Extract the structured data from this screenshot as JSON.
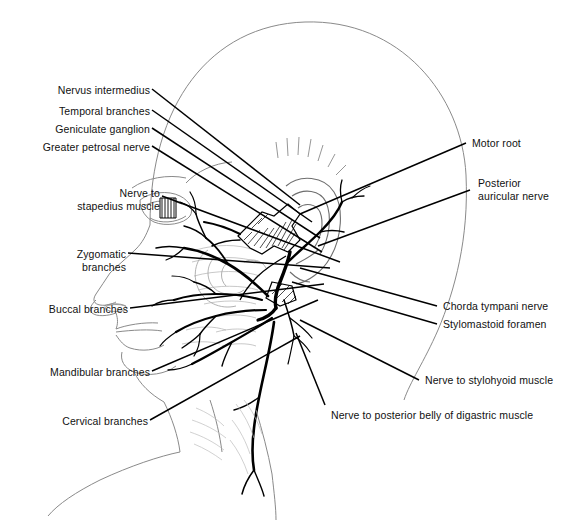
{
  "figure": {
    "orientation": "left lateral view, facing left",
    "line_color": "#000000",
    "outline_color": "#808080",
    "background": "#ffffff"
  },
  "labels": {
    "left": [
      {
        "id": "nervus-intermedius",
        "text": "Nervus intermedius",
        "x": 50,
        "y": 84,
        "anchor_x": 152,
        "anchor_y": 89,
        "target_x": 300,
        "target_y": 205
      },
      {
        "id": "temporal-branches",
        "text": "Temporal branches",
        "x": 38,
        "y": 105,
        "anchor_x": 152,
        "anchor_y": 110,
        "target_x": 312,
        "target_y": 222
      },
      {
        "id": "geniculate-ganglion",
        "text": "Geniculate ganglion",
        "x": 31,
        "y": 123,
        "anchor_x": 152,
        "anchor_y": 128,
        "target_x": 320,
        "target_y": 238
      },
      {
        "id": "greater-petrosal-nerve",
        "text": "Greater petrosal nerve",
        "x": 10,
        "y": 141,
        "anchor_x": 152,
        "anchor_y": 146,
        "target_x": 322,
        "target_y": 252
      },
      {
        "id": "nerve-to-stapedius-muscle",
        "lines": [
          "Nerve to",
          "stapedius muscle"
        ],
        "x": 36,
        "y": 187,
        "anchor_x": 162,
        "anchor_y": 196,
        "target_x": 340,
        "target_y": 262
      },
      {
        "id": "zygomatic-branches",
        "lines": [
          "Zygomatic",
          "branches"
        ],
        "x": 28,
        "y": 248,
        "anchor_x": 128,
        "anchor_y": 253,
        "target_x": 330,
        "target_y": 268
      },
      {
        "id": "buccal-branches",
        "text": "Buccal branches",
        "x": 22,
        "y": 303,
        "anchor_x": 130,
        "anchor_y": 308,
        "target_x": 324,
        "target_y": 284
      },
      {
        "id": "mandibular-branches",
        "text": "Mandibular branches",
        "x": 14,
        "y": 366,
        "anchor_x": 152,
        "anchor_y": 371,
        "target_x": 318,
        "target_y": 300
      },
      {
        "id": "cervical-branches",
        "text": "Cervical branches",
        "x": 28,
        "y": 415,
        "anchor_x": 150,
        "anchor_y": 420,
        "target_x": 300,
        "target_y": 336
      }
    ],
    "right": [
      {
        "id": "motor-root",
        "text": "Motor root",
        "x": 472,
        "y": 137,
        "anchor_x": 466,
        "anchor_y": 143,
        "target_x": 300,
        "target_y": 214
      },
      {
        "id": "posterior-auricular-nerve",
        "lines": [
          "Posterior",
          "auricular nerve"
        ],
        "x": 478,
        "y": 177,
        "anchor_x": 470,
        "anchor_y": 190,
        "target_x": 318,
        "target_y": 246
      },
      {
        "id": "chorda-tympani-nerve",
        "text": "Chorda tympani nerve",
        "x": 443,
        "y": 300,
        "anchor_x": 437,
        "anchor_y": 306,
        "target_x": 300,
        "target_y": 268
      },
      {
        "id": "stylomastoid-foramen",
        "text": "Stylomastoid foramen",
        "x": 443,
        "y": 318,
        "anchor_x": 437,
        "anchor_y": 324,
        "target_x": 292,
        "target_y": 282
      },
      {
        "id": "nerve-to-stylohyoid-muscle",
        "text": "Nerve to stylohyoid muscle",
        "x": 425,
        "y": 374,
        "anchor_x": 419,
        "anchor_y": 380,
        "target_x": 300,
        "target_y": 320
      },
      {
        "id": "nerve-to-posterior-belly-of-digastric-muscle",
        "text": "Nerve to posterior belly of digastric muscle",
        "x": 331,
        "y": 409,
        "anchor_x": 325,
        "anchor_y": 405,
        "target_x": 296,
        "target_y": 333
      }
    ]
  }
}
